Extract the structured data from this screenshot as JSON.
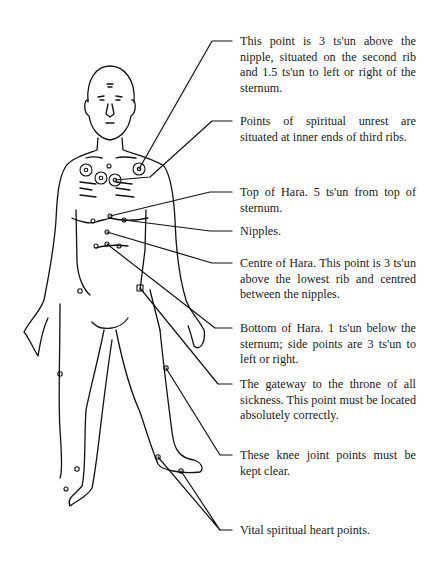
{
  "diagram": {
    "annotations": [
      {
        "id": "second-rib-point",
        "text": "This point is 3 ts'un above the nipple, situated on the second rib and 1.5 ts'un to left or right of the sternum."
      },
      {
        "id": "spiritual-unrest-points",
        "text": "Points of spiritual unrest are situated at inner ends of third ribs."
      },
      {
        "id": "top-of-hara",
        "text": "Top of Hara. 5 ts'un from top of sternum."
      },
      {
        "id": "nipples",
        "text": "Nipples."
      },
      {
        "id": "centre-of-hara",
        "text": "Centre of Hara. This point is 3 ts'un above the lowest rib and centred between the nipples."
      },
      {
        "id": "bottom-of-hara",
        "text": "Bottom of Hara. 1 ts'un below the sternum; side points are 3 ts'un to left or right."
      },
      {
        "id": "gateway-to-throne",
        "text": "The gateway to the throne of all sickness. This point must be located absolutely correctly."
      },
      {
        "id": "knee-joint-points",
        "text": "These knee joint points must be kept clear."
      },
      {
        "id": "vital-heart-points",
        "text": "Vital spiritual heart points."
      }
    ]
  }
}
